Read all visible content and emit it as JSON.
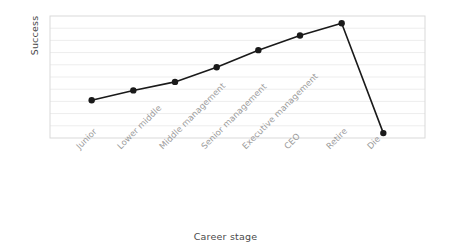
{
  "chart_data": {
    "type": "line",
    "title": "",
    "xlabel": "Career stage",
    "ylabel": "Success",
    "categories": [
      "Junior",
      "Lower middle",
      "Middle management",
      "Senior management",
      "Executive management",
      "CEO",
      "Retire",
      "Die"
    ],
    "values": [
      3.1,
      3.9,
      4.6,
      5.8,
      7.2,
      8.4,
      9.4,
      0.4
    ],
    "series": [
      {
        "name": "Success",
        "values": [
          3.1,
          3.9,
          4.6,
          5.8,
          7.2,
          8.4,
          9.4,
          0.4
        ]
      }
    ],
    "ylim": [
      0,
      10
    ],
    "xlim": [
      0,
      9
    ],
    "grid": "horizontal",
    "gridlines": 9,
    "legend": "none",
    "axis_tick_labels_y": [],
    "marker": "filled-circle",
    "line_color": "#1a1a1a",
    "marker_color": "#1a1a1a",
    "grid_color": "#ededed",
    "frame_color": "#d9d9d9",
    "background_color": "#ffffff",
    "tick_label_color": "#9b9b9b",
    "axis_label_color": "#4a4a4a",
    "tick_label_rotation": -45
  }
}
